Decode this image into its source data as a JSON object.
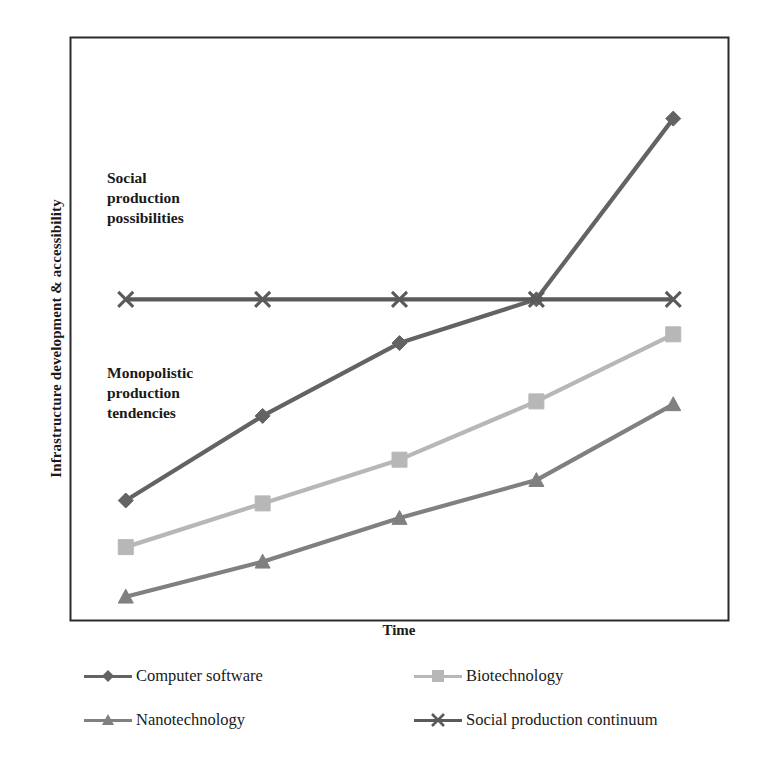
{
  "chart_data": {
    "type": "line",
    "title": "",
    "xlabel": "Time",
    "ylabel": "Infrastructure development & accessibility",
    "x": [
      1,
      2,
      3,
      4,
      5
    ],
    "xtick_labels": [
      "",
      "",
      "",
      "",
      ""
    ],
    "ytick_labels": [],
    "xlim": [
      0.6,
      5.4
    ],
    "ylim": [
      0,
      100
    ],
    "grid": false,
    "legend_position": "bottom",
    "series": [
      {
        "name": "Computer software",
        "color": "#636363",
        "marker": "diamond",
        "values": [
          20.5,
          35.0,
          47.5,
          55.0,
          86.0
        ]
      },
      {
        "name": "Biotechnology",
        "color": "#b7b7b7",
        "marker": "square",
        "values": [
          12.5,
          20.0,
          27.5,
          37.5,
          49.0
        ]
      },
      {
        "name": "Nanotechnology",
        "color": "#808080",
        "marker": "triangle",
        "values": [
          4.0,
          10.0,
          17.5,
          24.0,
          37.0
        ]
      },
      {
        "name": "Social production continuum",
        "color": "#5a5a5a",
        "marker": "cross",
        "values": [
          55.0,
          55.0,
          55.0,
          55.0,
          55.0
        ]
      }
    ],
    "annotations": [
      {
        "id": "social",
        "text": "Social\nproduction\npossibilities"
      },
      {
        "id": "monopolistic",
        "text": "Monopolistic\nproduction\ntendencies"
      }
    ]
  },
  "axes": {
    "frame_color": "#2b2b2b"
  },
  "legend": {
    "entries": [
      {
        "label": "Computer software",
        "color": "#636363",
        "marker": "diamond"
      },
      {
        "label": "Biotechnology",
        "color": "#b7b7b7",
        "marker": "square"
      },
      {
        "label": "Nanotechnology",
        "color": "#808080",
        "marker": "triangle"
      },
      {
        "label": "Social production continuum",
        "color": "#5a5a5a",
        "marker": "cross"
      }
    ]
  }
}
